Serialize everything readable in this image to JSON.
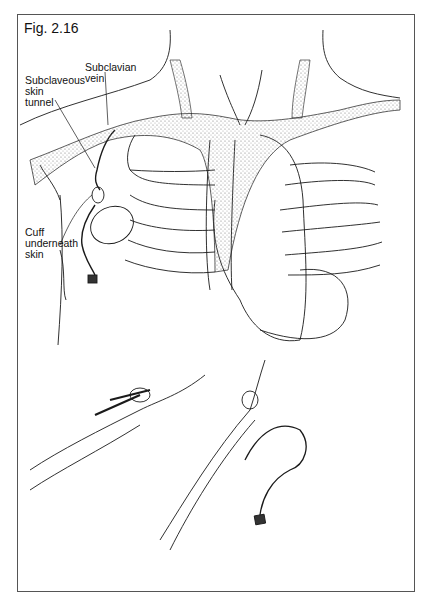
{
  "figure": {
    "title": "Fig. 2.16",
    "labels": {
      "subclavian_vein": "Subclavian\nvein",
      "subclaveous_tunnel": "Subclaveous\nskin\ntunnel",
      "cuff": "Cuff\nunderneath\nskin"
    },
    "colors": {
      "line": "#1a1a1a",
      "stipple": "#bdbdbd",
      "border": "#555555",
      "background": "#ffffff"
    }
  }
}
